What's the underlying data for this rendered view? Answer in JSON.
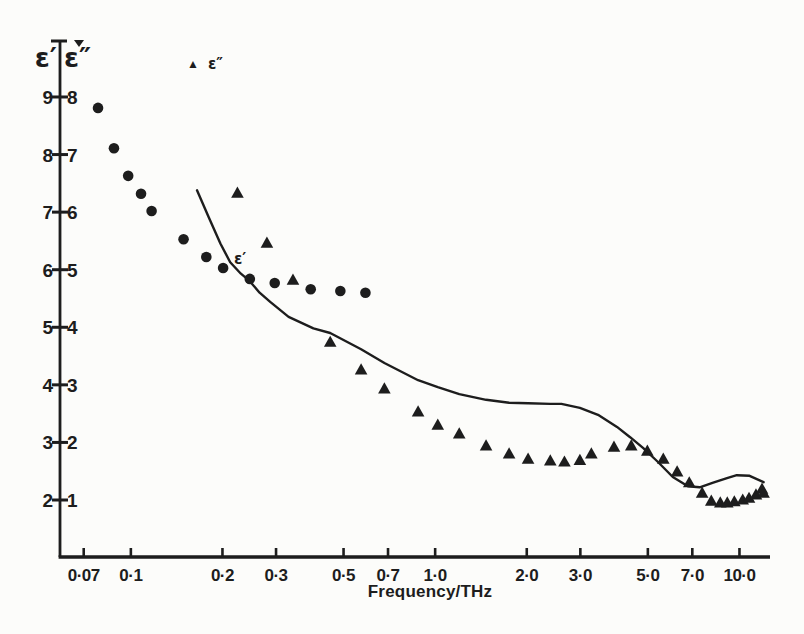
{
  "colors": {
    "ink": "#1d1d1d",
    "paper": "#fcfcfa"
  },
  "chart_data": {
    "type": "scatter",
    "title": "",
    "xlabel": "Frequency/THz",
    "x_scale": "log",
    "x_range": [
      0.0585,
      12.6
    ],
    "y_range_left": [
      1.01,
      9.955
    ],
    "grid": "off",
    "y_axis_left": {
      "label": "ε′",
      "ticks": [
        "9",
        "8",
        "7",
        "6",
        "5",
        "4",
        "3",
        "2"
      ]
    },
    "y_axis_right": {
      "label": "ε″",
      "ticks": [
        "8",
        "7",
        "6",
        "5",
        "4",
        "3",
        "2",
        "1"
      ]
    },
    "x_ticks": [
      {
        "label": "0·07",
        "value": 0.07
      },
      {
        "label": "0·1",
        "value": 0.1
      },
      {
        "label": "0·2",
        "value": 0.2
      },
      {
        "label": "0·3",
        "value": 0.3
      },
      {
        "label": "0·5",
        "value": 0.5
      },
      {
        "label": "0·7",
        "value": 0.7
      },
      {
        "label": "1·0",
        "value": 1.0
      },
      {
        "label": "2·0",
        "value": 2.0
      },
      {
        "label": "3·0",
        "value": 3.0
      },
      {
        "label": "5·0",
        "value": 5.0
      },
      {
        "label": "7·0",
        "value": 7.0
      },
      {
        "label": "10·0",
        "value": 10.0
      }
    ],
    "legend": {
      "glyph": "▲",
      "label": "ε″",
      "position": "top-left-inside"
    },
    "curve_label": "ε′",
    "series": [
      {
        "name": "epsilon-prime-circles",
        "marker": "circle",
        "axis": "left",
        "points": [
          [
            0.078,
            8.81
          ],
          [
            0.088,
            8.11
          ],
          [
            0.098,
            7.63
          ],
          [
            0.108,
            7.32
          ],
          [
            0.117,
            7.02
          ],
          [
            0.149,
            6.53
          ],
          [
            0.177,
            6.22
          ],
          [
            0.201,
            6.03
          ],
          [
            0.246,
            5.84
          ],
          [
            0.297,
            5.77
          ],
          [
            0.39,
            5.66
          ],
          [
            0.488,
            5.63
          ],
          [
            0.59,
            5.6
          ]
        ]
      },
      {
        "name": "epsilon-double-prime-triangles",
        "marker": "triangle",
        "axis": "right",
        "points": [
          [
            0.224,
            6.33
          ],
          [
            0.28,
            5.46
          ],
          [
            0.341,
            4.82
          ],
          [
            0.452,
            3.74
          ],
          [
            0.571,
            3.26
          ],
          [
            0.681,
            2.93
          ],
          [
            0.879,
            2.53
          ],
          [
            1.02,
            2.3
          ],
          [
            1.2,
            2.15
          ],
          [
            1.47,
            1.94
          ],
          [
            1.75,
            1.8
          ],
          [
            2.02,
            1.71
          ],
          [
            2.39,
            1.68
          ],
          [
            2.66,
            1.66
          ],
          [
            2.99,
            1.69
          ],
          [
            3.26,
            1.8
          ],
          [
            3.87,
            1.92
          ],
          [
            4.41,
            1.94
          ],
          [
            4.98,
            1.85
          ],
          [
            5.62,
            1.71
          ],
          [
            6.24,
            1.49
          ],
          [
            6.84,
            1.3
          ],
          [
            7.54,
            1.12
          ],
          [
            8.08,
            0.98
          ],
          [
            8.65,
            0.95
          ],
          [
            9.12,
            0.95
          ],
          [
            9.62,
            0.97
          ],
          [
            10.25,
            1.0
          ],
          [
            10.75,
            1.03
          ],
          [
            11.33,
            1.09
          ],
          [
            11.86,
            1.19
          ],
          [
            12.0,
            1.12
          ]
        ]
      },
      {
        "name": "epsilon-prime-curve",
        "type": "line",
        "axis": "left",
        "points": [
          [
            0.165,
            7.38
          ],
          [
            0.18,
            6.92
          ],
          [
            0.197,
            6.45
          ],
          [
            0.212,
            6.13
          ],
          [
            0.23,
            5.93
          ],
          [
            0.246,
            5.8
          ],
          [
            0.265,
            5.6
          ],
          [
            0.287,
            5.44
          ],
          [
            0.33,
            5.18
          ],
          [
            0.398,
            4.98
          ],
          [
            0.452,
            4.9
          ],
          [
            0.571,
            4.62
          ],
          [
            0.681,
            4.38
          ],
          [
            0.879,
            4.08
          ],
          [
            1.02,
            3.96
          ],
          [
            1.2,
            3.84
          ],
          [
            1.47,
            3.74
          ],
          [
            1.75,
            3.69
          ],
          [
            2.02,
            3.68
          ],
          [
            2.39,
            3.67
          ],
          [
            2.6,
            3.67
          ],
          [
            2.99,
            3.6
          ],
          [
            3.43,
            3.48
          ],
          [
            3.96,
            3.27
          ],
          [
            4.37,
            3.09
          ],
          [
            4.83,
            2.9
          ],
          [
            5.4,
            2.66
          ],
          [
            6.04,
            2.4
          ],
          [
            6.77,
            2.24
          ],
          [
            7.4,
            2.22
          ],
          [
            8.2,
            2.3
          ],
          [
            9.1,
            2.38
          ],
          [
            9.8,
            2.43
          ],
          [
            10.8,
            2.42
          ],
          [
            12.0,
            2.31
          ]
        ]
      }
    ]
  }
}
